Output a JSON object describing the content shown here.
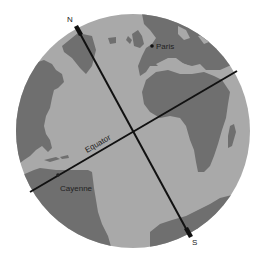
{
  "figure": {
    "type": "globe-diagram",
    "colors": {
      "ocean": "#a9a9a9",
      "land": "#6f6f6f",
      "lines": "#111111",
      "background": "#ffffff"
    },
    "labels": {
      "north": "N",
      "south": "S",
      "equator": "Equator",
      "city_1": "Paris",
      "city_2": "Cayenne"
    }
  }
}
